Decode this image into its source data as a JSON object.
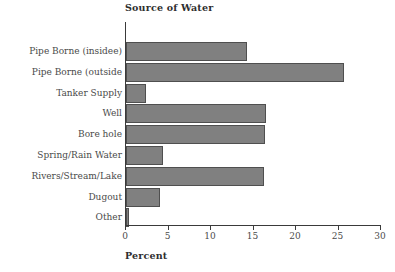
{
  "chart_data": {
    "type": "bar",
    "orientation": "horizontal",
    "title": "Source of Water",
    "xlabel": "Percent",
    "ylabel": "",
    "categories": [
      "Pipe Borne (insidee)",
      "Pipe Borne (outside",
      "Tanker Supply",
      "Well",
      "Bore hole",
      "Spring/Rain Water",
      "Rivers/Stream/Lake",
      "Dugout",
      "Other"
    ],
    "values": [
      14.2,
      25.7,
      2.3,
      16.5,
      16.3,
      4.3,
      16.2,
      4.0,
      0.3
    ],
    "xlim": [
      0,
      30
    ],
    "xticks": [
      0,
      5,
      10,
      15,
      20,
      25,
      30
    ],
    "xtick_labels": [
      "0",
      "5",
      "10",
      "15",
      "20",
      "25",
      "30"
    ],
    "grid": false,
    "legend": false,
    "bar_color": "#808080",
    "bar_edge_color": "#4f4f4f",
    "axis_color": "#3a3a3a",
    "text_color": "#4a4a4a",
    "background": "#ffffff"
  }
}
